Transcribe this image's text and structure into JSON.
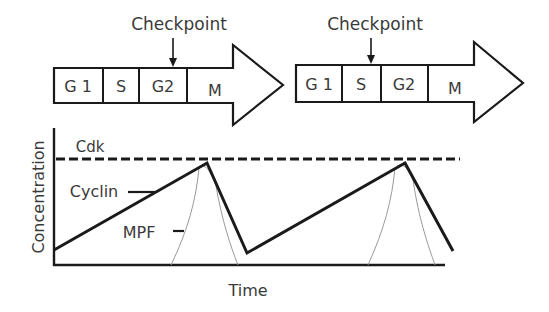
{
  "colors": {
    "stroke": "#1a1a1a",
    "text": "#3a3a3a",
    "mpf": "#9a9a9a",
    "background": "#ffffff"
  },
  "cycle1": {
    "checkpoint_label": "Checkpoint",
    "checkpoint_position": "G2",
    "phases": [
      "G 1",
      "S",
      "G2",
      "M"
    ]
  },
  "cycle2": {
    "checkpoint_label": "Checkpoint",
    "checkpoint_position": "S/G2 boundary",
    "phases": [
      "G 1",
      "S",
      "G2",
      "M"
    ]
  },
  "graph": {
    "y_axis_label": "Concentration",
    "x_axis_label": "Time",
    "series_labels": {
      "cdk": "Cdk",
      "cyclin": "Cyclin",
      "mpf": "MPF"
    },
    "series": [
      {
        "name": "Cdk",
        "style": "dashed",
        "description": "constant high level"
      },
      {
        "name": "Cyclin",
        "style": "solid thick",
        "description": "rises gradually, peaks, drops sharply; repeats"
      },
      {
        "name": "MPF",
        "style": "thin curve",
        "description": "sharp bell-shaped peak coinciding with cyclin peak"
      }
    ]
  }
}
